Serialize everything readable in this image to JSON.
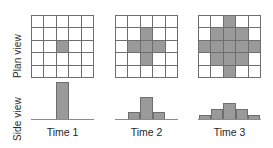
{
  "figure": {
    "row_labels": {
      "plan": "Plan view",
      "side": "Side view"
    },
    "column_labels": [
      "Time 1",
      "Time 2",
      "Time 3"
    ]
  },
  "colors": {
    "cell_fill": "#9a9a9a",
    "cell_empty": "#ffffff",
    "grid_line": "#6e6e6e",
    "bar_fill": "#9a9a9a",
    "bar_outline": "#6e6e6e",
    "baseline": "#8c8c8c",
    "text": "#1f1f1f",
    "background": "#ffffff"
  },
  "chart_data": {
    "type": "heatmap",
    "title": "",
    "subtitle": "",
    "xlabel": "",
    "ylabel": "",
    "legend_position": "none",
    "grid": true,
    "grid_size": [
      5,
      5
    ],
    "categories": [
      "Time 1",
      "Time 2",
      "Time 3"
    ],
    "panels": [
      {
        "label": "Time 1",
        "plan_view": {
          "rows": [
            [
              0,
              0,
              0,
              0,
              0
            ],
            [
              0,
              0,
              0,
              0,
              0
            ],
            [
              0,
              0,
              1,
              0,
              0
            ],
            [
              0,
              0,
              0,
              0,
              0
            ],
            [
              0,
              0,
              0,
              0,
              0
            ]
          ],
          "filled_count": 1
        },
        "side_view": {
          "x": [
            1,
            2,
            3,
            4,
            5
          ],
          "values": [
            0,
            0,
            5,
            0,
            0
          ],
          "ylim": [
            0,
            5
          ]
        }
      },
      {
        "label": "Time 2",
        "plan_view": {
          "rows": [
            [
              0,
              0,
              0,
              0,
              0
            ],
            [
              0,
              0,
              1,
              0,
              0
            ],
            [
              0,
              1,
              1,
              1,
              0
            ],
            [
              0,
              0,
              1,
              0,
              0
            ],
            [
              0,
              0,
              0,
              0,
              0
            ]
          ],
          "filled_count": 5
        },
        "side_view": {
          "x": [
            1,
            2,
            3,
            4,
            5
          ],
          "values": [
            0,
            1,
            3,
            1,
            0
          ],
          "ylim": [
            0,
            5
          ]
        }
      },
      {
        "label": "Time 3",
        "plan_view": {
          "rows": [
            [
              0,
              0,
              1,
              0,
              0
            ],
            [
              0,
              1,
              1,
              1,
              0
            ],
            [
              1,
              1,
              1,
              1,
              1
            ],
            [
              0,
              1,
              1,
              1,
              0
            ],
            [
              0,
              0,
              1,
              0,
              0
            ]
          ],
          "filled_count": 13
        },
        "side_view": {
          "x": [
            1,
            2,
            3,
            4,
            5
          ],
          "values": [
            0.6,
            1.4,
            2.2,
            1.4,
            0.6
          ],
          "ylim": [
            0,
            5
          ]
        }
      }
    ]
  }
}
